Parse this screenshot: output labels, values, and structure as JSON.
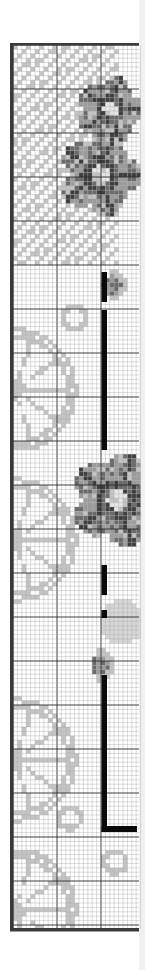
{
  "pattern": {
    "type": "cross-stitch chart",
    "colors": {
      "background": "#ffffff",
      "grid_minor": "#9a9a9a",
      "grid_major": "#2a2a2a",
      "border": "#3a3a3a",
      "light_gray": "#c4c4c4",
      "mid_gray": "#9c9c9c",
      "dark_gray": "#6a6a6a",
      "darkest": "#3e3e3e",
      "black_line": "#0a0a0a",
      "right_strip": "#f1f1f1"
    },
    "grid": {
      "left": 13,
      "top": 45,
      "right": 139,
      "bottom": 929,
      "cell_size": 4.4,
      "major_every": 10
    },
    "motifs": [
      {
        "name": "flower",
        "label": "upper flower cluster",
        "cx": 105,
        "cy": 130
      },
      {
        "name": "flower",
        "label": "middle flower",
        "cx": 118,
        "cy": 500
      },
      {
        "name": "bud",
        "label": "upper bud",
        "cx": 112,
        "cy": 285
      },
      {
        "name": "bud",
        "label": "lower bud",
        "cx": 100,
        "cy": 665
      },
      {
        "name": "citrus-slice",
        "label": "citrus slice 1",
        "cy": 390
      },
      {
        "name": "citrus-slice",
        "label": "citrus slice 2",
        "cy": 540
      },
      {
        "name": "citrus-slice",
        "label": "citrus slice 3",
        "cy": 760
      },
      {
        "name": "citrus-slice",
        "label": "citrus slice 4",
        "cy": 910
      },
      {
        "name": "ring",
        "label": "ring 1",
        "cx": 75,
        "cy": 318
      },
      {
        "name": "ring",
        "label": "ring 2",
        "cx": 70,
        "cy": 818
      },
      {
        "name": "ring",
        "label": "ring 3",
        "cx": 115,
        "cy": 862
      }
    ],
    "stem_line": {
      "vertical_x": 104,
      "vertical_top": 272,
      "vertical_bottom": 832,
      "horizontal_y": 826,
      "horizontal_right": 137
    }
  }
}
